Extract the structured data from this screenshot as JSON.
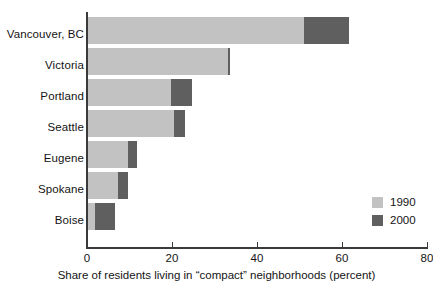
{
  "chart_data": {
    "type": "bar",
    "orientation": "horizontal",
    "stacked": true,
    "title": "",
    "xlabel": "Share of residents living in “compact” neighborhoods (percent)",
    "ylabel": "",
    "xlim": [
      0,
      80
    ],
    "xticks": [
      0,
      20,
      40,
      60,
      80
    ],
    "xtick_labels": [
      "0",
      "20",
      "40",
      "60",
      "80"
    ],
    "grid": false,
    "legend_position": "inside-right-lower",
    "categories": [
      "Vancouver, BC",
      "Victoria",
      "Portland",
      "Seattle",
      "Eugene",
      "Spokane",
      "Boise"
    ],
    "series": [
      {
        "name": "1990",
        "color": "#c2c2c2",
        "values": [
          50.8,
          33.0,
          19.8,
          20.5,
          9.6,
          7.3,
          1.9
        ]
      },
      {
        "name": "2000",
        "color": "#5f5f5f",
        "values": [
          10.6,
          0.6,
          4.9,
          2.6,
          2.1,
          2.4,
          4.7
        ]
      }
    ],
    "totals": [
      61.4,
      33.6,
      24.7,
      23.1,
      11.7,
      9.7,
      6.6
    ],
    "legend": [
      {
        "label": "1990",
        "color": "#c2c2c2"
      },
      {
        "label": "2000",
        "color": "#5f5f5f"
      }
    ]
  }
}
